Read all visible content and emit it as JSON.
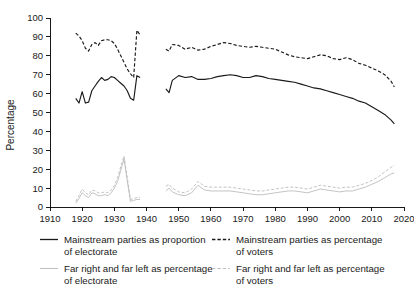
{
  "chart_data": {
    "type": "line",
    "title": "",
    "subtitle": "",
    "xlabel": "",
    "ylabel": "Percentage",
    "xlim": [
      1910,
      2020
    ],
    "ylim": [
      0,
      100
    ],
    "xticks": [
      1910,
      1920,
      1930,
      1940,
      1950,
      1960,
      1970,
      1980,
      1990,
      2000,
      2010,
      2020
    ],
    "yticks": [
      0,
      10,
      20,
      30,
      40,
      50,
      60,
      70,
      80,
      90,
      100
    ],
    "grid": false,
    "legend_position": "below",
    "note": "Two time segments separated by a World War II gap (data absent 1939-1945).",
    "series": [
      {
        "name": "Mainstream parties as proportion of electorate",
        "style": "solid",
        "color": "#1a1a1a",
        "segments": [
          {
            "x": [
              1918,
              1919,
              1920,
              1921,
              1922,
              1923,
              1924,
              1925,
              1926,
              1927,
              1928,
              1929,
              1930,
              1931,
              1932,
              1933,
              1934,
              1935,
              1936,
              1937,
              1938
            ],
            "y": [
              57.5,
              55.0,
              61.0,
              55.0,
              55.5,
              61.5,
              64.0,
              66.5,
              68.5,
              67.0,
              67.5,
              69.0,
              68.5,
              67.0,
              65.5,
              64.0,
              61.5,
              57.5,
              56.5,
              69.5,
              68.5
            ]
          },
          {
            "x": [
              1946,
              1947,
              1948,
              1950,
              1952,
              1954,
              1956,
              1958,
              1960,
              1962,
              1964,
              1966,
              1968,
              1970,
              1972,
              1974,
              1976,
              1978,
              1980,
              1982,
              1984,
              1986,
              1988,
              1990,
              1992,
              1994,
              1996,
              1998,
              2000,
              2002,
              2004,
              2006,
              2008,
              2010,
              2012,
              2014,
              2016,
              2017
            ],
            "y": [
              62.5,
              60.5,
              67.0,
              69.5,
              68.5,
              69.0,
              67.5,
              67.5,
              68.0,
              69.0,
              69.5,
              70.0,
              69.5,
              68.5,
              68.5,
              69.5,
              69.0,
              68.0,
              67.5,
              67.0,
              66.5,
              66.0,
              65.0,
              64.0,
              63.0,
              62.5,
              61.5,
              60.5,
              59.5,
              58.5,
              57.5,
              56.0,
              55.0,
              53.0,
              51.0,
              49.0,
              46.0,
              44.0
            ]
          }
        ]
      },
      {
        "name": "Mainstream parties as percentage of voters",
        "style": "dashed",
        "color": "#1a1a1a",
        "segments": [
          {
            "x": [
              1918,
              1919,
              1920,
              1921,
              1922,
              1923,
              1924,
              1925,
              1926,
              1927,
              1928,
              1929,
              1930,
              1931,
              1932,
              1933,
              1934,
              1935,
              1936,
              1937,
              1938
            ],
            "y": [
              92.0,
              90.5,
              88.0,
              84.0,
              82.5,
              86.0,
              87.0,
              85.5,
              88.0,
              88.5,
              88.5,
              88.0,
              86.5,
              83.5,
              80.0,
              76.5,
              73.0,
              70.5,
              68.5,
              93.5,
              91.0
            ]
          },
          {
            "x": [
              1946,
              1947,
              1948,
              1950,
              1952,
              1954,
              1956,
              1958,
              1960,
              1962,
              1964,
              1966,
              1968,
              1970,
              1972,
              1974,
              1976,
              1978,
              1980,
              1982,
              1984,
              1986,
              1988,
              1990,
              1992,
              1994,
              1996,
              1998,
              2000,
              2002,
              2004,
              2006,
              2008,
              2010,
              2012,
              2014,
              2016,
              2017
            ],
            "y": [
              83.5,
              82.5,
              86.0,
              85.5,
              83.5,
              84.5,
              83.0,
              83.5,
              85.0,
              86.0,
              87.0,
              86.5,
              85.5,
              85.0,
              84.5,
              85.0,
              84.5,
              84.0,
              83.5,
              82.0,
              80.5,
              79.5,
              79.0,
              78.5,
              79.5,
              80.5,
              80.0,
              78.5,
              78.0,
              79.0,
              78.0,
              76.0,
              75.0,
              73.5,
              72.0,
              70.0,
              66.5,
              63.5
            ]
          }
        ]
      },
      {
        "name": "Far right and far left as percentage of electorate",
        "style": "solid",
        "color": "#b8b8b8",
        "segments": [
          {
            "x": [
              1918,
              1919,
              1920,
              1921,
              1922,
              1923,
              1924,
              1925,
              1926,
              1927,
              1928,
              1929,
              1930,
              1931,
              1932,
              1933,
              1934,
              1935,
              1936,
              1937,
              1938
            ],
            "y": [
              2.0,
              4.5,
              7.5,
              6.0,
              5.0,
              7.5,
              7.0,
              6.0,
              6.0,
              6.5,
              6.0,
              7.5,
              10.0,
              13.5,
              19.5,
              25.5,
              14.0,
              3.0,
              3.5,
              4.0,
              4.0
            ]
          },
          {
            "x": [
              1946,
              1947,
              1948,
              1950,
              1952,
              1954,
              1956,
              1958,
              1960,
              1962,
              1964,
              1966,
              1968,
              1970,
              1972,
              1974,
              1976,
              1978,
              1980,
              1982,
              1984,
              1986,
              1988,
              1990,
              1992,
              1994,
              1996,
              1998,
              2000,
              2002,
              2004,
              2006,
              2008,
              2010,
              2012,
              2014,
              2016,
              2017
            ],
            "y": [
              8.5,
              10.0,
              8.0,
              6.5,
              6.0,
              7.5,
              11.5,
              9.0,
              8.5,
              8.5,
              8.5,
              8.5,
              8.0,
              7.5,
              7.0,
              6.5,
              6.5,
              7.0,
              7.5,
              8.0,
              8.5,
              8.5,
              8.0,
              7.5,
              8.5,
              9.5,
              9.0,
              8.5,
              8.0,
              8.5,
              8.5,
              9.5,
              10.5,
              12.0,
              13.5,
              15.5,
              17.5,
              18.0
            ]
          }
        ]
      },
      {
        "name": "Far right and far left as percentage of voters",
        "style": "dashed",
        "color": "#b8b8b8",
        "segments": [
          {
            "x": [
              1918,
              1919,
              1920,
              1921,
              1922,
              1923,
              1924,
              1925,
              1926,
              1927,
              1928,
              1929,
              1930,
              1931,
              1932,
              1933,
              1934,
              1935,
              1936,
              1937,
              1938
            ],
            "y": [
              3.0,
              6.0,
              9.5,
              7.5,
              6.5,
              9.0,
              8.5,
              7.5,
              7.5,
              8.0,
              7.5,
              9.0,
              11.5,
              15.5,
              21.5,
              27.0,
              15.5,
              4.0,
              4.5,
              5.0,
              5.0
            ]
          },
          {
            "x": [
              1946,
              1947,
              1948,
              1950,
              1952,
              1954,
              1956,
              1958,
              1960,
              1962,
              1964,
              1966,
              1968,
              1970,
              1972,
              1974,
              1976,
              1978,
              1980,
              1982,
              1984,
              1986,
              1988,
              1990,
              1992,
              1994,
              1996,
              1998,
              2000,
              2002,
              2004,
              2006,
              2008,
              2010,
              2012,
              2014,
              2016,
              2017
            ],
            "y": [
              11.0,
              12.0,
              10.0,
              8.0,
              7.5,
              9.5,
              13.5,
              11.0,
              10.5,
              10.5,
              10.5,
              10.5,
              10.0,
              9.5,
              9.0,
              8.5,
              8.5,
              9.0,
              9.5,
              10.0,
              10.5,
              10.5,
              10.0,
              9.5,
              10.5,
              11.5,
              11.0,
              10.5,
              10.0,
              10.5,
              10.5,
              11.5,
              12.5,
              14.0,
              16.0,
              18.5,
              21.0,
              22.0
            ]
          }
        ]
      }
    ]
  },
  "axis": {
    "ylabel": "Percentage",
    "yticks": [
      "0",
      "10",
      "20",
      "30",
      "40",
      "50",
      "60",
      "70",
      "80",
      "90",
      "100"
    ],
    "xticks": [
      "1910",
      "1920",
      "1930",
      "1940",
      "1950",
      "1960",
      "1970",
      "1980",
      "1990",
      "2000",
      "2010",
      "2020"
    ]
  },
  "legend": {
    "items": [
      {
        "label_line1": "Mainstream parties as proportion",
        "label_line2": "of electorate",
        "style": "solid",
        "color": "#1a1a1a"
      },
      {
        "label_line1": "Mainstream parties as percentage",
        "label_line2": "of voters",
        "style": "dashed",
        "color": "#1a1a1a"
      },
      {
        "label_line1": "Far right and far left as percentage",
        "label_line2": "of electorate",
        "style": "solid",
        "color": "#b8b8b8"
      },
      {
        "label_line1": "Far right and far left as percentage",
        "label_line2": "of voters",
        "style": "dashed",
        "color": "#b8b8b8"
      }
    ]
  }
}
